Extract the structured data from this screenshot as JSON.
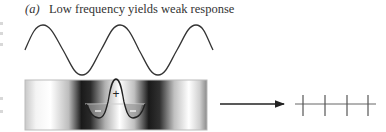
{
  "figure": {
    "panel_label": "(a)",
    "caption": "Low frequency yields weak response",
    "stimulus": {
      "type": "sine-wave",
      "cycles_visible": 2.5,
      "stroke_color": "#333333"
    },
    "grating": {
      "type": "luminance-grating-with-receptive-field",
      "center_sign": "+",
      "surround_sign": "−",
      "border_color": "#bbbbbb"
    },
    "arrow": {
      "direction": "right",
      "color": "#222222"
    },
    "response": {
      "type": "spike-train",
      "spike_count": 4,
      "strength": "weak",
      "color": "#555555"
    }
  }
}
